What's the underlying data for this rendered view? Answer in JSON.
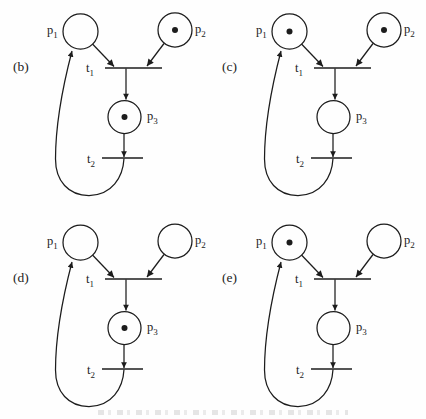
{
  "figure": {
    "type": "petri-net-marking-sequence",
    "colors": {
      "line": "#1c1c1c",
      "background": "#fefefe",
      "token": "#1c1c1c"
    },
    "node_labels": {
      "p1": {
        "base": "p",
        "sub": "1"
      },
      "p2": {
        "base": "p",
        "sub": "2"
      },
      "p3": {
        "base": "p",
        "sub": "3"
      },
      "t1": {
        "base": "t",
        "sub": "1"
      },
      "t2": {
        "base": "t",
        "sub": "2"
      }
    },
    "structure": {
      "places": [
        "p1",
        "p2",
        "p3"
      ],
      "transitions": [
        "t1",
        "t2"
      ],
      "arcs": [
        "p1->t1",
        "p2->t1",
        "t1->p3",
        "p3->t2",
        "t2->p1"
      ]
    },
    "diagrams": [
      {
        "label": "(b)",
        "tokens": {
          "p1": 0,
          "p2": 1,
          "p3": 1
        }
      },
      {
        "label": "(c)",
        "tokens": {
          "p1": 1,
          "p2": 1,
          "p3": 0
        }
      },
      {
        "label": "(d)",
        "tokens": {
          "p1": 0,
          "p2": 0,
          "p3": 1
        }
      },
      {
        "label": "(e)",
        "tokens": {
          "p1": 1,
          "p2": 0,
          "p3": 0
        }
      }
    ]
  }
}
